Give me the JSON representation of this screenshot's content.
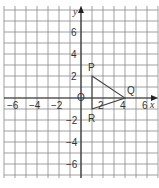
{
  "diagram": {
    "type": "coordinate-grid",
    "axes": {
      "x_label": "x",
      "y_label": "y",
      "origin_label": "O"
    },
    "x_ticks": [
      "−6",
      "−4",
      "−2",
      "2",
      "4",
      "6"
    ],
    "y_ticks": [
      "6",
      "4",
      "2",
      "−2",
      "−4",
      "−6"
    ],
    "x_tick_values": [
      -6,
      -4,
      -2,
      2,
      4,
      6
    ],
    "y_tick_values": [
      6,
      4,
      2,
      -2,
      -4,
      -6
    ],
    "grid": {
      "x_min": -7,
      "x_max": 7,
      "y_min": -7,
      "y_max": 8
    },
    "triangle": {
      "vertices": [
        {
          "label": "P",
          "x": 1,
          "y": 2
        },
        {
          "label": "Q",
          "x": 4,
          "y": 0
        },
        {
          "label": "R",
          "x": 1,
          "y": -1
        }
      ]
    },
    "colors": {
      "grid": "#888888",
      "axes": "#333333",
      "shape": "#444444"
    }
  }
}
